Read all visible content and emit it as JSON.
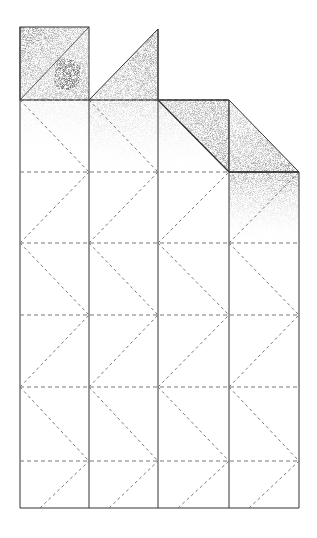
{
  "figure": {
    "title": "",
    "columns": 4,
    "rows": 6,
    "colors": {
      "line": "#333333",
      "dash": "#777777",
      "shade": "#555555",
      "blob": "#3a3a3a",
      "background": "#ffffff"
    },
    "top_flaps": [
      {
        "name": "top-left-square-flap",
        "column": 1,
        "shape": "square with diagonal fold and dark spot"
      },
      {
        "name": "top-triangle-flap",
        "column": 2,
        "shape": "right triangle"
      },
      {
        "name": "folded-corner-flap-a",
        "column": 3,
        "shape": "folded parallelogram"
      },
      {
        "name": "folded-corner-flap-b",
        "column": 4,
        "shape": "folded triangle"
      }
    ]
  }
}
